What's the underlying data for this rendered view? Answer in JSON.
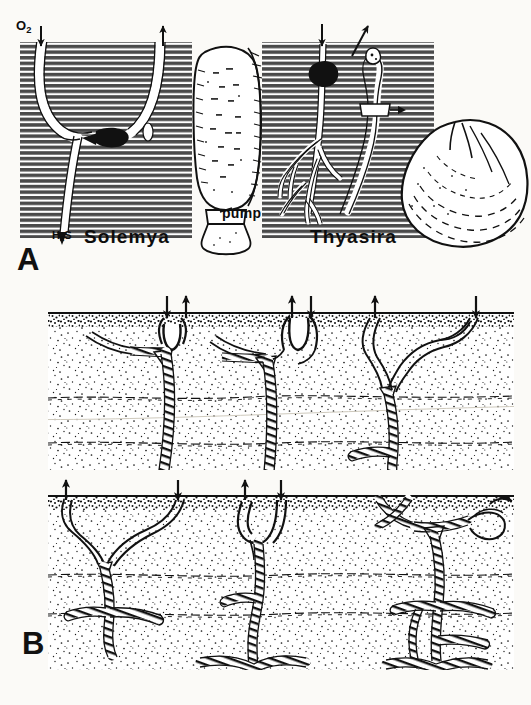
{
  "figure": {
    "background_color": "#fbfaf7",
    "ink_color": "#111111",
    "width": 531,
    "height": 705
  },
  "panels": [
    {
      "id": "A",
      "label": "A",
      "caption_labels": {
        "left_taxon": "Solemya",
        "right_taxon": "Thyasira",
        "oxygen": "O",
        "oxygen_subscript": "2",
        "sulfide": "H",
        "sulfide_subscript": "2",
        "sulfide_tail": "S",
        "pump": "pump"
      },
      "scenes": [
        {
          "name": "solemya-burrow",
          "taxon": "Solemya",
          "burrow_shape": "Y-shaped",
          "arrows": [
            {
              "name": "oxygen-inflow-arrow",
              "direction": "down",
              "label": "O2"
            },
            {
              "name": "exhalant-outflow-arrow",
              "direction": "up",
              "label": ""
            }
          ],
          "features": [
            "animal-in-burrow-blob",
            "sulfide-supply-limb",
            "sediment-hatching"
          ]
        },
        {
          "name": "thyasira-burrow",
          "taxon": "Thyasira",
          "burrow_shape": "branching pedal tubes",
          "arrows": [
            {
              "name": "inhalant-arrow",
              "direction": "down",
              "label": ""
            },
            {
              "name": "exhalant-arrow",
              "direction": "up-right",
              "label": ""
            }
          ],
          "features": [
            "animal-in-burrow-blob",
            "siphon",
            "branched-foot-tubes",
            "sediment-hatching"
          ]
        }
      ],
      "shells": [
        {
          "name": "solemya-shell",
          "outline": "elongate, radially ribbed",
          "has_pump_foot": true
        },
        {
          "name": "thyasira-shell",
          "outline": "rounded-triangular, concentric growth lines",
          "has_pump_foot": false
        }
      ]
    },
    {
      "id": "B",
      "label": "B",
      "rows": [
        {
          "name": "upper-row",
          "burrows": [
            {
              "name": "burrow-b1",
              "arrows": [
                {
                  "name": "inhalant-arrow",
                  "direction": "down"
                },
                {
                  "name": "exhalant-arrow",
                  "direction": "up"
                }
              ],
              "surface_feature": "funnel-depression",
              "depth_class": "deep single shaft"
            },
            {
              "name": "burrow-b2",
              "arrows": [
                {
                  "name": "exhalant-arrow",
                  "direction": "up"
                },
                {
                  "name": "inhalant-arrow",
                  "direction": "down"
                }
              ],
              "surface_feature": "u-tube-opening",
              "depth_class": "deep shaft with basal gallery"
            },
            {
              "name": "burrow-b3",
              "arrows": [
                {
                  "name": "exhalant-arrow",
                  "direction": "up"
                },
                {
                  "name": "inhalant-arrow",
                  "direction": "down"
                }
              ],
              "surface_feature": "paired smooth tubes",
              "depth_class": "mid-depth branched"
            }
          ]
        },
        {
          "name": "lower-row",
          "burrows": [
            {
              "name": "burrow-b4",
              "arrows": [
                {
                  "name": "exhalant-arrow",
                  "direction": "up"
                },
                {
                  "name": "inhalant-arrow",
                  "direction": "down"
                }
              ],
              "surface_feature": "paired smooth tubes",
              "depth_class": "shallow branched gallery"
            },
            {
              "name": "burrow-b5",
              "arrows": [
                {
                  "name": "exhalant-arrow",
                  "direction": "up"
                },
                {
                  "name": "inhalant-arrow",
                  "direction": "down"
                }
              ],
              "surface_feature": "u-tube-opening",
              "depth_class": "deep shaft with basal gallery"
            },
            {
              "name": "burrow-b6",
              "arrows": [],
              "surface_feature": "multiple crossing tubes",
              "depth_class": "complex anastomosing network"
            }
          ]
        }
      ],
      "sediment": {
        "stipple": true,
        "surface_band": "dark organic-rich veneer",
        "horizon_lines": 2,
        "horizon_style": "dashed irregular"
      }
    }
  ],
  "ghost_text": {
    "line_1": "",
    "line_2": ""
  }
}
